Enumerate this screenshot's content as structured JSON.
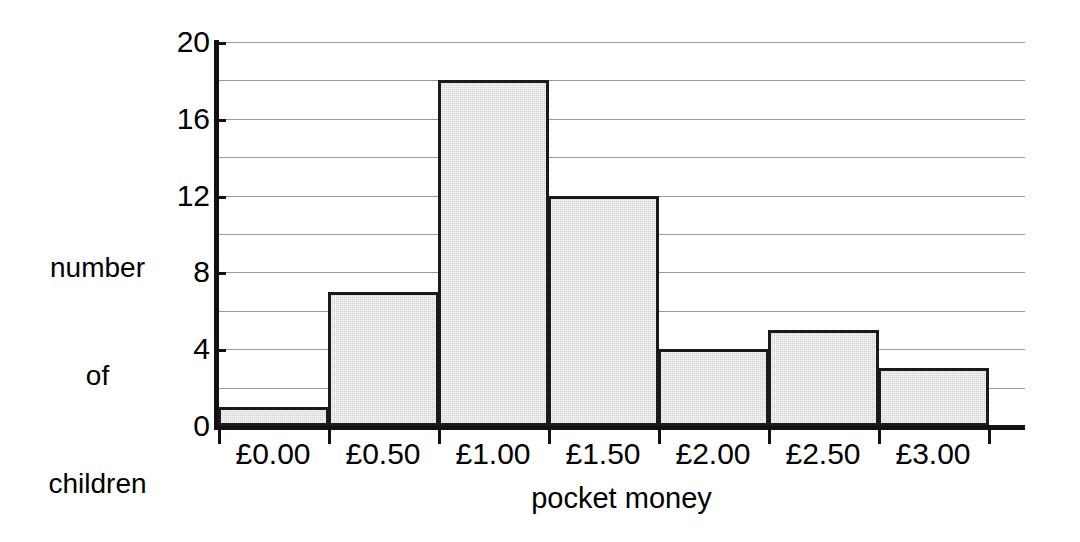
{
  "chart_data": {
    "type": "bar",
    "title": "",
    "subtitle": "",
    "xlabel": "pocket money",
    "ylabel": "number of children",
    "ylabel_lines": [
      "number",
      "of",
      "children"
    ],
    "categories": [
      "£0.00",
      "£0.50",
      "£1.00",
      "£1.50",
      "£2.00",
      "£2.50",
      "£3.00"
    ],
    "values": [
      1,
      7,
      18,
      12,
      4,
      5,
      3
    ],
    "ylim": [
      0,
      20
    ],
    "y_tick_labels": [
      "0",
      "4",
      "8",
      "12",
      "16",
      "20"
    ],
    "y_tick_values": [
      0,
      4,
      8,
      12,
      16,
      20
    ],
    "gridline_values": [
      2,
      4,
      6,
      8,
      10,
      12,
      14,
      16,
      18,
      20
    ],
    "grid": true,
    "legend": "none",
    "bar_fill_color": "#d2d2d2",
    "bar_border_color": "#1a1a1a",
    "axis_color": "#111111",
    "gridline_color": "#9a9a9a",
    "background_color": "#ffffff"
  }
}
